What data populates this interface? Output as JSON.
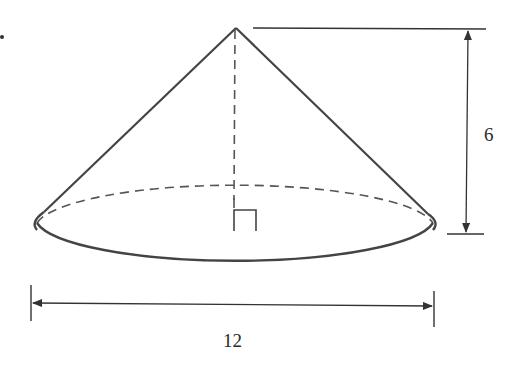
{
  "figure": {
    "type": "right circular cone",
    "colors": {
      "stroke": "#444444",
      "dimension": "#333333",
      "text": "#2a2a2a",
      "background": "#ffffff"
    }
  },
  "dimensions": {
    "height": {
      "label": "6",
      "orientation": "vertical"
    },
    "diameter": {
      "label": "12",
      "orientation": "horizontal"
    }
  },
  "markers": {
    "right_angle": "right-angle-marker at base center"
  }
}
